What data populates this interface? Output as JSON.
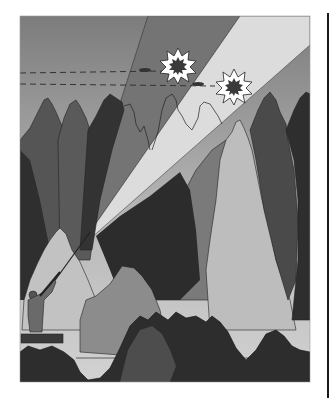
{
  "figure": {
    "frame": {
      "x": 20,
      "y": 16,
      "width": 290,
      "height": 366
    },
    "colors": {
      "sky_top": "#7c7c7c",
      "sky_bottom": "#cfcfcf",
      "shot_cone_dark": "#777777",
      "shot_cone_light": "#dadada",
      "tree_darkest": "#2e2e2e",
      "tree_dark": "#4a4a4a",
      "tree_mid": "#6e6e6e",
      "tree_light": "#a9a9a9",
      "tree_lightest": "#c4c4c4",
      "outline": "#222222",
      "burst_fill": "#ffffff",
      "burst_core": "#3a3a3a"
    },
    "elements": {
      "bursts": [
        {
          "name": "upper-burst",
          "cx": 178,
          "cy": 66
        },
        {
          "name": "lower-burst",
          "cx": 234,
          "cy": 87
        }
      ],
      "flight_paths": [
        {
          "name": "upper-flight-path",
          "y": 73,
          "x1": 20,
          "x2": 165
        },
        {
          "name": "lower-flight-path",
          "y": 84,
          "x1": 20,
          "x2": 215
        }
      ],
      "birds": [
        {
          "name": "upper-bird",
          "cx": 145,
          "cy": 71
        },
        {
          "name": "lower-bird",
          "cx": 198,
          "cy": 84
        }
      ],
      "hunter": {
        "x": 30,
        "y": 292
      },
      "stand": {
        "x": 21,
        "y": 335,
        "width": 42,
        "height": 8
      }
    }
  }
}
